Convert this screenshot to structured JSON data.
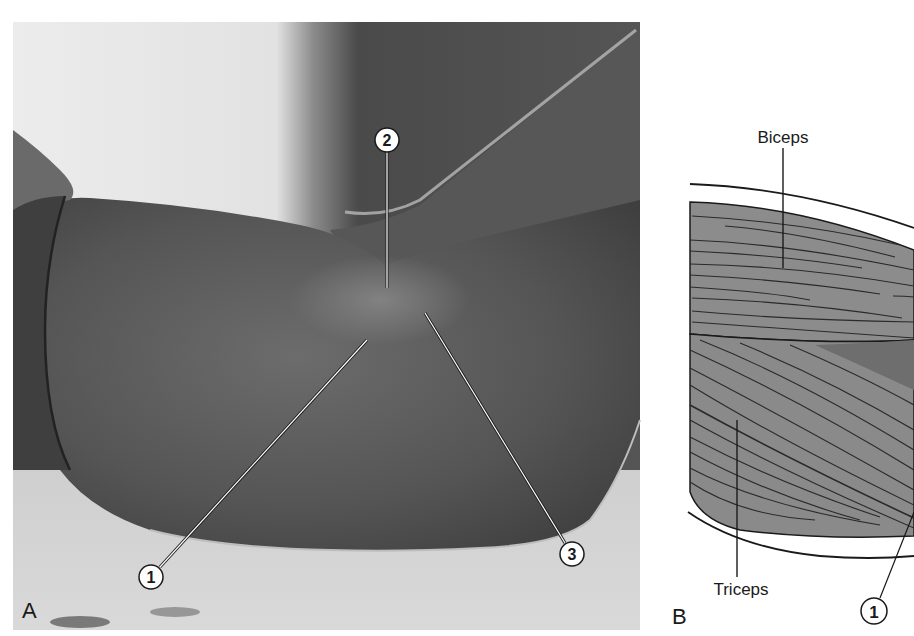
{
  "figure": {
    "panels": [
      {
        "id": "A",
        "letter": "A",
        "kind": "photograph",
        "callouts": [
          {
            "number": "1",
            "label": "1"
          },
          {
            "number": "2",
            "label": "2"
          },
          {
            "number": "3",
            "label": "3"
          }
        ]
      },
      {
        "id": "B",
        "letter": "B",
        "kind": "illustration",
        "labels": {
          "biceps": "Biceps",
          "triceps": "Triceps"
        },
        "callouts": [
          {
            "number": "1",
            "label": "1"
          }
        ]
      }
    ],
    "colors": {
      "photo_background_light": "#e6e6e6",
      "photo_arm_dark": "#5a5a5a",
      "muscle_fill": "#8c8c8c",
      "muscle_fill_dark": "#6e6e6e",
      "fiber_line": "#2a2a2a",
      "outline": "#1a1a1a",
      "callout_fill": "#ffffff"
    }
  }
}
